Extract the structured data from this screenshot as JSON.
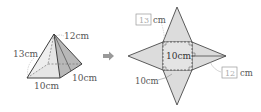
{
  "pyramid": {
    "labels": {
      "slant_height": "12cm",
      "lateral_edge": "13cm",
      "base_front": "10cm",
      "base_side": "10cm"
    }
  },
  "arrow": {
    "icon": "right-arrow-icon"
  },
  "net": {
    "square_label": "10cm",
    "base_edge_label": "10cm",
    "lateral_edge_answer": "13",
    "slant_height_answer": "12",
    "unit": "cm"
  },
  "colors": {
    "face_light": "#e8e8e8",
    "face_mid": "#d2d2d2",
    "face_dark": "#b4b4b4",
    "stroke": "#4a4a4a",
    "text": "#555555",
    "arrow": "#999999"
  }
}
